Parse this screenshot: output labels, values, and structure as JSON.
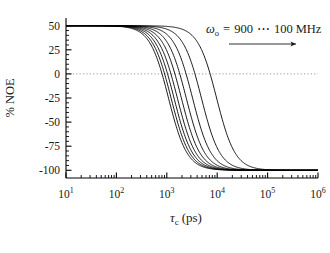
{
  "figure": {
    "background": "#ffffff",
    "line_color": "#000000",
    "zero_line_color": "#8a8a8a"
  },
  "annotation": {
    "omega_symbol": "ω",
    "omega_subscript": "o",
    "equals": "=",
    "high_value": "900",
    "ellipsis": "⋯",
    "low_value": "100",
    "units": "MHz",
    "full_text": "ωo = 900 ⋯ 100 MHz",
    "arrow_direction": "right"
  },
  "chart_data": {
    "type": "line",
    "title": "",
    "xlabel": "τc (ps)",
    "xlabel_symbol": "τ",
    "xlabel_subscript": "c",
    "xlabel_units": "(ps)",
    "ylabel": "% NOE",
    "xscale": "log",
    "yscale": "linear",
    "xlim": [
      10,
      1000000
    ],
    "ylim": [
      -108,
      58
    ],
    "grid": false,
    "zero_reference_line": 0,
    "xticks": [
      10,
      100,
      1000,
      10000,
      100000,
      1000000
    ],
    "xticklabels": [
      "10¹",
      "10²",
      "10³",
      "10⁴",
      "10⁵",
      "10⁶"
    ],
    "xtick_mantissas": [
      "10",
      "10",
      "10",
      "10",
      "10",
      "10"
    ],
    "xtick_exponents": [
      "1",
      "2",
      "3",
      "4",
      "5",
      "6"
    ],
    "yticks": [
      50,
      25,
      0,
      -25,
      -50,
      -75,
      -100
    ],
    "yticklabels": [
      "50",
      "25",
      "0",
      "-25",
      "-50",
      "-75",
      "-100"
    ],
    "ytick_minor_count": 4,
    "legend": {
      "position": "top-right",
      "entries": [
        "ωo = 900 ⋯ 100 MHz"
      ]
    },
    "plateau_high": 50,
    "plateau_low": -100,
    "series": [
      {
        "name": "900 MHz",
        "omega_mhz": 900,
        "midpoint_tau_ps": 1080,
        "values_note": "sigmoid from +50 to -100 in log tau"
      },
      {
        "name": "800 MHz",
        "omega_mhz": 800,
        "midpoint_tau_ps": 1215
      },
      {
        "name": "700 MHz",
        "omega_mhz": 700,
        "midpoint_tau_ps": 1390
      },
      {
        "name": "600 MHz",
        "omega_mhz": 600,
        "midpoint_tau_ps": 1620
      },
      {
        "name": "500 MHz",
        "omega_mhz": 500,
        "midpoint_tau_ps": 1945
      },
      {
        "name": "400 MHz",
        "omega_mhz": 400,
        "midpoint_tau_ps": 2430
      },
      {
        "name": "300 MHz",
        "omega_mhz": 300,
        "midpoint_tau_ps": 3240
      },
      {
        "name": "200 MHz",
        "omega_mhz": 200,
        "midpoint_tau_ps": 4860
      },
      {
        "name": "100 MHz",
        "omega_mhz": 100,
        "midpoint_tau_ps": 9720
      }
    ]
  }
}
